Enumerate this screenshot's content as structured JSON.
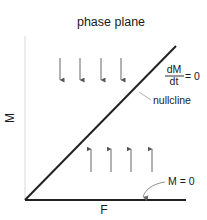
{
  "title": "phase plane",
  "axes": {
    "x_label": "F",
    "y_label": "M",
    "origin": [
      25,
      200
    ],
    "x_end": [
      186,
      200
    ],
    "y_end": [
      25,
      36
    ]
  },
  "nullcline": {
    "start": [
      25,
      200
    ],
    "end": [
      176,
      46
    ],
    "label": "nullcline",
    "equation": {
      "numerator": "dM",
      "denominator": "dt",
      "rhs": "= 0"
    }
  },
  "m_zero": {
    "label": "M = 0"
  },
  "arrows": {
    "down": {
      "x": [
        60,
        80,
        101,
        121
      ],
      "y_top": 58,
      "y_bottom": 80
    },
    "up": {
      "x": [
        91,
        111,
        131,
        152
      ],
      "y_top": 149,
      "y_bottom": 172
    }
  },
  "colors": {
    "axis_dark": "#222222",
    "axis_light": "#d8d8d8",
    "arrow": "#555555",
    "leader": "#888888",
    "text": "#1a1a1a"
  }
}
